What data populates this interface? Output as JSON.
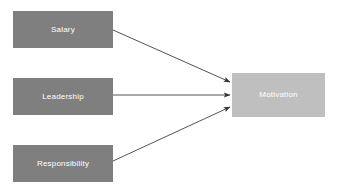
{
  "diagram": {
    "type": "path-diagram",
    "background_color": "#ffffff",
    "width": 337,
    "height": 191,
    "nodes": [
      {
        "id": "salary",
        "label": "Salary",
        "role": "predictor",
        "fill_color": "#7f7f7f",
        "text_color": "#ffffff",
        "x": 13,
        "y": 11,
        "w": 100,
        "h": 37
      },
      {
        "id": "leadership",
        "label": "Leadership",
        "role": "predictor",
        "fill_color": "#7f7f7f",
        "text_color": "#ffffff",
        "x": 13,
        "y": 78,
        "w": 100,
        "h": 37
      },
      {
        "id": "responsibility",
        "label": "Responsibility",
        "role": "predictor",
        "fill_color": "#7f7f7f",
        "text_color": "#ffffff",
        "x": 13,
        "y": 145,
        "w": 100,
        "h": 37
      },
      {
        "id": "motivation",
        "label": "Motivation",
        "role": "outcome",
        "fill_color": "#bfbfbf",
        "text_color": "#ffffff",
        "x": 232,
        "y": 73,
        "w": 93,
        "h": 44
      }
    ],
    "edges": [
      {
        "id": "salary-to-motivation",
        "from": "salary",
        "to": "motivation",
        "label": "",
        "color": "#404040",
        "x1": 113,
        "y1": 30,
        "x2": 230,
        "y2": 82
      },
      {
        "id": "leadership-to-motivation",
        "from": "leadership",
        "to": "motivation",
        "label": "",
        "color": "#404040",
        "x1": 113,
        "y1": 95,
        "x2": 230,
        "y2": 95
      },
      {
        "id": "responsibility-to-motivation",
        "from": "responsibility",
        "to": "motivation",
        "label": "",
        "color": "#404040",
        "x1": 113,
        "y1": 161,
        "x2": 230,
        "y2": 107
      }
    ]
  }
}
